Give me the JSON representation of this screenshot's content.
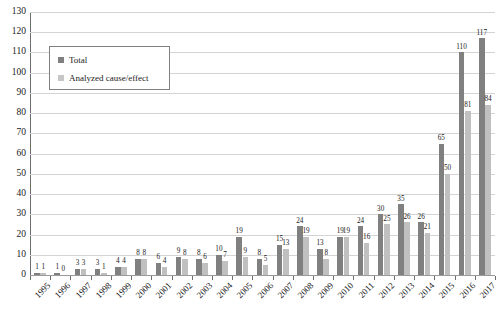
{
  "chart_data": {
    "type": "bar",
    "title": "",
    "subtitle": "",
    "xlabel": "",
    "ylabel": "",
    "ylim": [
      0,
      130
    ],
    "ytick_step": 10,
    "yticks": [
      0,
      10,
      20,
      30,
      40,
      50,
      60,
      70,
      80,
      90,
      100,
      110,
      120,
      130
    ],
    "grid": true,
    "legend_position": "top-left",
    "categories": [
      "1995",
      "1996",
      "1997",
      "1998",
      "1999",
      "2000",
      "2001",
      "2002",
      "2003",
      "2004",
      "2005",
      "2006",
      "2007",
      "2008",
      "2009",
      "2010",
      "2011",
      "2012",
      "2013",
      "2014",
      "2015",
      "2016",
      "2017"
    ],
    "series": [
      {
        "name": "Total",
        "color": "#808080",
        "values": [
          1,
          1,
          3,
          3,
          4,
          8,
          6,
          9,
          8,
          10,
          19,
          8,
          15,
          24,
          13,
          19,
          24,
          30,
          35,
          26,
          65,
          110,
          117
        ]
      },
      {
        "name": "Analyzed cause/effect",
        "color": "#c0c0c0",
        "values": [
          1,
          0,
          3,
          1,
          4,
          8,
          4,
          8,
          6,
          7,
          9,
          5,
          13,
          19,
          8,
          19,
          16,
          25,
          26,
          21,
          50,
          81,
          84
        ]
      }
    ]
  },
  "legend": {
    "items": [
      {
        "label": "Total",
        "swatch": "total-swatch"
      },
      {
        "label": "Analyzed cause/effect",
        "swatch": "analyzed-swatch"
      }
    ]
  },
  "colors": {
    "total": "#808080",
    "analyzed": "#c0c0c0",
    "gridline": "#d4d4d4",
    "axis": "#6e6e6e",
    "text": "#1a1a1a",
    "background": "#ffffff"
  }
}
